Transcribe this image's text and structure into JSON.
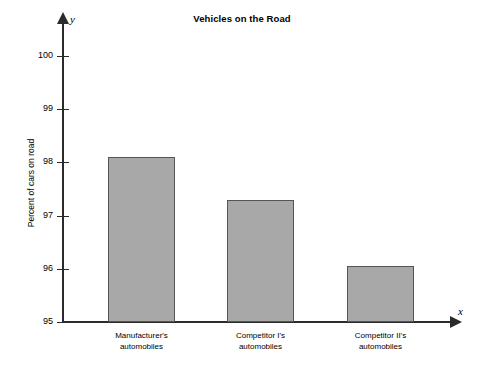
{
  "chart_data": {
    "type": "bar",
    "title": "Vehicles on the Road",
    "xlabel": "",
    "ylabel": "Percent of cars on road",
    "categories": [
      "Manufacturer's automobiles",
      "Competitor I's automobiles",
      "Competitor II's automobiles"
    ],
    "category_lines": [
      [
        "Manufacturer's",
        "automobiles"
      ],
      [
        "Competitor I's",
        "automobiles"
      ],
      [
        "Competitor II's",
        "automobiles"
      ]
    ],
    "values": [
      98.1,
      97.3,
      96.05
    ],
    "ylim": [
      95,
      100
    ],
    "yticks": [
      95,
      96,
      97,
      98,
      99,
      100
    ],
    "ytick_labels": [
      "95",
      "96",
      "97",
      "98",
      "99",
      "100"
    ],
    "grid": false,
    "legend": null,
    "axis_symbols": {
      "x": "x",
      "y": "y"
    },
    "bar_color": "#a8a8a8",
    "bar_edge_color": "#555555",
    "axis_color": "#2b2b2b"
  }
}
